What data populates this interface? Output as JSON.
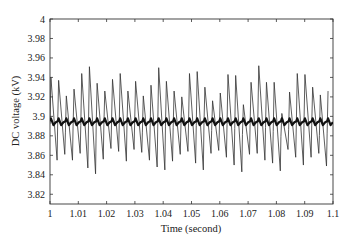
{
  "chart_data": {
    "type": "line",
    "title": "",
    "xlabel": "Time (second)",
    "ylabel": "DC voltage (kV)",
    "xlim": [
      1,
      1.1
    ],
    "ylim": [
      3.81,
      4.0
    ],
    "grid": false,
    "legend": null,
    "x_ticks": [
      1,
      1.01,
      1.02,
      1.03,
      1.04,
      1.05,
      1.06,
      1.07,
      1.08,
      1.09,
      1.1
    ],
    "x_tick_labels": [
      "1",
      "1.01",
      "1.02",
      "1.03",
      "1.04",
      "1.05",
      "1.06",
      "1.07",
      "1.08",
      "1.09",
      "1.1"
    ],
    "y_ticks": [
      4.0,
      3.98,
      3.96,
      3.94,
      3.92,
      3.9,
      3.88,
      3.86,
      3.84,
      3.82
    ],
    "y_tick_labels": [
      "4",
      "3.98",
      "3.96",
      "3.94",
      "3.92",
      "3.9",
      "3.88",
      "3.86",
      "3.84",
      "3.82"
    ],
    "series": [
      {
        "name": "DC voltage (oscillating, thin)",
        "style": "thin",
        "color": "#333333",
        "period": 0.00272,
        "peaks": [
          3.94,
          3.937,
          3.921,
          3.928,
          3.944,
          3.951,
          3.934,
          3.926,
          3.938,
          3.944,
          3.926,
          3.936,
          3.921,
          3.932,
          3.95,
          3.936,
          3.926,
          3.92,
          3.944,
          3.946,
          3.93,
          3.916,
          3.924,
          3.943,
          3.942,
          3.912,
          3.935,
          3.952,
          3.935,
          3.935,
          3.903,
          3.925,
          3.944,
          3.943,
          3.93,
          3.922,
          3.926
        ],
        "troughs": [
          3.855,
          3.861,
          3.855,
          3.862,
          3.847,
          3.841,
          3.856,
          3.867,
          3.864,
          3.854,
          3.866,
          3.863,
          3.855,
          3.848,
          3.845,
          3.854,
          3.861,
          3.864,
          3.852,
          3.845,
          3.862,
          3.865,
          3.858,
          3.85,
          3.843,
          3.861,
          3.862,
          3.855,
          3.852,
          3.844,
          3.866,
          3.858,
          3.85,
          3.858,
          3.862,
          3.849,
          3.848
        ]
      },
      {
        "name": "DC voltage (average, thick)",
        "style": "thick",
        "color": "#111111",
        "period": 0.00272,
        "peaks": [
          3.898
        ],
        "troughs": [
          3.891
        ],
        "mean": 3.895
      }
    ]
  }
}
